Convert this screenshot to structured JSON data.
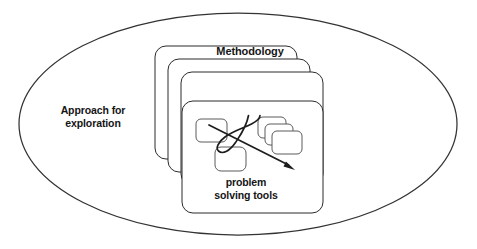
{
  "figure": {
    "title": "Approach for exploration",
    "background_color": "#ffffff",
    "stroke_color": "#2b2b2b",
    "width": 477,
    "height": 249
  },
  "labels": {
    "container_label": "Approach for\nexploration",
    "stack_label": "Methodology",
    "inner_label": "problem\nsolving tools"
  },
  "shapes": {
    "ellipse": {
      "name": "approach-for-exploration-ellipse",
      "cx": 238,
      "cy": 124,
      "rx": 219,
      "ry": 111
    },
    "card_stack": {
      "name": "methodology-card-stack",
      "count": 4,
      "offset_x": 13,
      "offset_y": 13,
      "card_width": 142,
      "card_height": 113,
      "corner_radius": 10,
      "first_card_x": 155,
      "first_card_y": 46
    },
    "inner_nodes": [
      {
        "name": "node-left",
        "x": 196,
        "y": 119,
        "w": 31,
        "h": 23
      },
      {
        "name": "node-bottom",
        "x": 215,
        "y": 147,
        "w": 31,
        "h": 24
      },
      {
        "name": "node-stack-back",
        "x": 258,
        "y": 117,
        "w": 28,
        "h": 21
      },
      {
        "name": "node-stack-middle",
        "x": 265,
        "y": 124,
        "w": 28,
        "h": 21
      },
      {
        "name": "node-stack-front",
        "x": 272,
        "y": 131,
        "w": 30,
        "h": 23
      }
    ],
    "squiggle": {
      "name": "squiggle-path",
      "description": "S-shaped curve linking the node group"
    },
    "arrow": {
      "name": "diagonal-arrow",
      "start_x": 209,
      "start_y": 125,
      "tip_x": 295,
      "tip_y": 170
    }
  }
}
